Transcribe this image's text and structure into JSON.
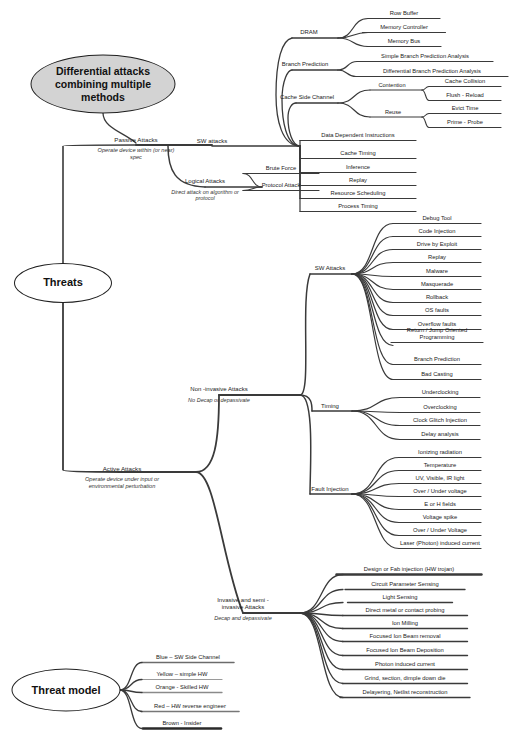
{
  "diagram": {
    "title_nodes": [
      {
        "id": "differential",
        "label": "Differential attacks combining multiple methods",
        "style": "filled-ellipse",
        "cx": 103,
        "cy": 84,
        "w": 143,
        "h": 57,
        "font": 10.5
      },
      {
        "id": "threats",
        "label": "Threats",
        "style": "plain-ellipse",
        "cx": 63,
        "cy": 283,
        "w": 96,
        "h": 38,
        "font": 11
      },
      {
        "id": "threat_model",
        "label": "Threat model",
        "style": "plain-ellipse",
        "cx": 66,
        "cy": 690,
        "w": 107,
        "h": 41,
        "font": 11
      }
    ],
    "branches": [
      {
        "id": "passive",
        "label": "Passive Attacks",
        "sub": "Operate device within (or near) spec",
        "x": 136,
        "y": 143,
        "font": 6.2,
        "sub_font": 5.6,
        "weight": 2.0
      },
      {
        "id": "active",
        "label": "Active Attacks",
        "sub": "Operate device under input or environmental perturbation",
        "x": 122,
        "y": 472,
        "font": 6.2,
        "sub_font": 5.6,
        "weight": 2.0
      },
      {
        "id": "sw_attacks_passive",
        "label": "SW attacks",
        "x": 212,
        "y": 145,
        "font": 6.0,
        "weight": 1.6
      },
      {
        "id": "logical",
        "label": "Logical Attacks",
        "sub": "Direct attack on algorithm or protocol",
        "x": 205,
        "y": 185,
        "font": 6.0,
        "sub_font": 5.4,
        "weight": 1.4
      },
      {
        "id": "dram",
        "label": "DRAM",
        "x": 309,
        "y": 36,
        "font": 5.9,
        "weight": 1.3
      },
      {
        "id": "branch_prediction",
        "label": "Branch Prediction",
        "x": 305,
        "y": 68,
        "font": 5.9,
        "weight": 1.3
      },
      {
        "id": "cache_side_channel",
        "label": "Cache Side Channel",
        "x": 307,
        "y": 101,
        "font": 5.9,
        "weight": 1.3
      },
      {
        "id": "contention",
        "label": "Contention",
        "x": 392,
        "y": 89,
        "font": 5.6,
        "weight": 1.1
      },
      {
        "id": "reuse",
        "label": "Reuse",
        "x": 393,
        "y": 116,
        "font": 5.6,
        "weight": 1.1
      },
      {
        "id": "non_invasive",
        "label": "Non -invasive Attacks",
        "sub": "No Decap or depassivate",
        "x": 219,
        "y": 393,
        "font": 6.0,
        "sub_font": 5.5,
        "weight": 1.8
      },
      {
        "id": "invasive",
        "label": "Invasive and semi - invasive Attacks",
        "sub": "Decap and depassivate",
        "x": 243,
        "y": 611,
        "font": 6.0,
        "sub_font": 5.5,
        "weight": 1.8,
        "two_line": true
      },
      {
        "id": "sw_attacks_active",
        "label": "SW Attacks",
        "x": 330,
        "y": 272,
        "font": 6.0,
        "weight": 1.5
      },
      {
        "id": "timing",
        "label": "Timing",
        "x": 330,
        "y": 410,
        "font": 6.0,
        "weight": 1.5
      },
      {
        "id": "fault_injection",
        "label": "Fault Injection",
        "x": 330,
        "y": 493,
        "font": 6.0,
        "weight": 1.5
      }
    ],
    "leaves": [
      {
        "id": "row_buffer",
        "label": "Row Buffer",
        "x": 404,
        "y": 17,
        "w": 72,
        "weight": 1.2
      },
      {
        "id": "memory_controller",
        "label": "Memory Controller",
        "x": 404,
        "y": 31,
        "w": 83,
        "weight": 1.2
      },
      {
        "id": "memory_bus",
        "label": "Memory Bus",
        "x": 404,
        "y": 45,
        "w": 74,
        "weight": 1.2
      },
      {
        "id": "simple_bpa",
        "label": "Simple Branch Prediction Analysis",
        "x": 425,
        "y": 60,
        "w": 136,
        "weight": 1.2
      },
      {
        "id": "diff_bpa",
        "label": "Differential Branch Prediction Analysis",
        "x": 432,
        "y": 75,
        "w": 152,
        "weight": 1.2
      },
      {
        "id": "cache_collision",
        "label": "Cache Collision",
        "x": 465,
        "y": 85,
        "w": 72,
        "weight": 1.1
      },
      {
        "id": "flush_reload",
        "label": "Flush - Reload",
        "x": 465,
        "y": 99,
        "w": 72,
        "weight": 1.1
      },
      {
        "id": "evict_time",
        "label": "Evict Time",
        "x": 465,
        "y": 112,
        "w": 72,
        "weight": 1.1
      },
      {
        "id": "prime_probe",
        "label": "Prime - Probe",
        "x": 465,
        "y": 126,
        "w": 72,
        "weight": 1.1
      },
      {
        "id": "data_dep_instr",
        "label": "Data Dependent Instructions",
        "x": 358,
        "y": 139,
        "w": 116,
        "weight": 1.2
      },
      {
        "id": "cache_timing",
        "label": "Cache Timing",
        "x": 358,
        "y": 157,
        "w": 116,
        "weight": 1.2
      },
      {
        "id": "inference",
        "label": "Inference",
        "x": 358,
        "y": 171,
        "w": 116,
        "weight": 1.2
      },
      {
        "id": "replay_passive",
        "label": "Replay",
        "x": 358,
        "y": 184,
        "w": 116,
        "weight": 1.2
      },
      {
        "id": "resource_scheduling",
        "label": "Resource Scheduling",
        "x": 358,
        "y": 197,
        "w": 116,
        "weight": 1.2
      },
      {
        "id": "process_timing",
        "label": "Process Timing",
        "x": 358,
        "y": 210,
        "w": 116,
        "weight": 1.2
      },
      {
        "id": "brute_force",
        "label": "Brute Force",
        "x": 281,
        "y": 172,
        "w": 76,
        "weight": 1.1
      },
      {
        "id": "protocol_attack",
        "label": "Protocol Attack",
        "x": 281,
        "y": 189,
        "w": 76,
        "weight": 1.1
      },
      {
        "id": "debug_tool",
        "label": "Debug Tool",
        "x": 437,
        "y": 222,
        "w": 88,
        "weight": 1.2
      },
      {
        "id": "code_injection",
        "label": "Code Injection",
        "x": 437,
        "y": 235,
        "w": 88,
        "weight": 1.2
      },
      {
        "id": "drive_by_exploit",
        "label": "Drive by Exploit",
        "x": 437,
        "y": 248,
        "w": 88,
        "weight": 1.2
      },
      {
        "id": "replay_sw",
        "label": "Replay",
        "x": 437,
        "y": 261,
        "w": 88,
        "weight": 1.2
      },
      {
        "id": "malware",
        "label": "Malware",
        "x": 437,
        "y": 275,
        "w": 88,
        "weight": 1.2
      },
      {
        "id": "masquerade",
        "label": "Masquerade",
        "x": 437,
        "y": 288,
        "w": 88,
        "weight": 1.2
      },
      {
        "id": "rollback",
        "label": "Rollback",
        "x": 437,
        "y": 301,
        "w": 88,
        "weight": 1.2
      },
      {
        "id": "os_faults",
        "label": "OS faults",
        "x": 437,
        "y": 314,
        "w": 88,
        "weight": 1.2
      },
      {
        "id": "overflow_faults",
        "label": "Overflow faults",
        "x": 437,
        "y": 328,
        "w": 88,
        "weight": 1.2
      },
      {
        "id": "rop_jop",
        "label": "Return / Jump Oriented Programming",
        "x": 437,
        "y": 341,
        "w": 92,
        "weight": 1.2,
        "two_line": true
      },
      {
        "id": "branch_prediction_sw",
        "label": "Branch Prediction",
        "x": 437,
        "y": 363,
        "w": 88,
        "weight": 1.2
      },
      {
        "id": "bad_casting",
        "label": "Bad Casting",
        "x": 437,
        "y": 378,
        "w": 88,
        "weight": 1.2
      },
      {
        "id": "underclocking",
        "label": "Underclocking",
        "x": 440,
        "y": 396,
        "w": 80,
        "weight": 1.2
      },
      {
        "id": "overclocking",
        "label": "Overclocking",
        "x": 440,
        "y": 411,
        "w": 80,
        "weight": 1.2
      },
      {
        "id": "clock_glitch",
        "label": "Clock Glitch Injection",
        "x": 440,
        "y": 424,
        "w": 80,
        "weight": 1.2
      },
      {
        "id": "delay_analysis",
        "label": "Delay analysis",
        "x": 440,
        "y": 438,
        "w": 80,
        "weight": 1.2
      },
      {
        "id": "ionizing_radiation",
        "label": "Ionizing radiation",
        "x": 440,
        "y": 456,
        "w": 82,
        "weight": 1.2
      },
      {
        "id": "temperature",
        "label": "Temperature",
        "x": 440,
        "y": 469,
        "w": 82,
        "weight": 1.2
      },
      {
        "id": "uv_vis_ir",
        "label": "UV, Visible, IR light",
        "x": 440,
        "y": 482,
        "w": 82,
        "weight": 1.2
      },
      {
        "id": "over_under_voltage_1",
        "label": "Over / Under voltage",
        "x": 440,
        "y": 495,
        "w": 82,
        "weight": 1.2
      },
      {
        "id": "e_or_h_fields",
        "label": "E or H fields",
        "x": 440,
        "y": 508,
        "w": 82,
        "weight": 1.2
      },
      {
        "id": "voltage_spike",
        "label": "Voltage spike",
        "x": 440,
        "y": 521,
        "w": 82,
        "weight": 1.2
      },
      {
        "id": "over_under_voltage_2",
        "label": "Over / Under Voltage",
        "x": 440,
        "y": 534,
        "w": 82,
        "weight": 1.2
      },
      {
        "id": "laser_photon",
        "label": "Laser (Photon) induced current",
        "x": 440,
        "y": 547,
        "w": 82,
        "weight": 1.2
      },
      {
        "id": "design_fab_injection",
        "label": "Design or Fab injection (HW trojan)",
        "x": 409,
        "y": 573,
        "w": 145,
        "weight": 2.4
      },
      {
        "id": "circuit_param_sensing",
        "label": "Circuit Parameter Sensing",
        "x": 405,
        "y": 588,
        "w": 120,
        "weight": 1.4
      },
      {
        "id": "light_sensing",
        "label": "Light Sensing",
        "x": 400,
        "y": 601,
        "w": 105,
        "weight": 1.4
      },
      {
        "id": "direct_probing",
        "label": "Direct metal or contact probing",
        "x": 405,
        "y": 614,
        "w": 125,
        "weight": 1.4
      },
      {
        "id": "ion_milling",
        "label": "Ion Milling",
        "x": 405,
        "y": 627,
        "w": 125,
        "weight": 1.4
      },
      {
        "id": "fib_removal",
        "label": "Focused Ion Beam removal",
        "x": 405,
        "y": 640,
        "w": 125,
        "weight": 1.4
      },
      {
        "id": "fib_deposition",
        "label": "Focused Ion Beam Deposition",
        "x": 405,
        "y": 654,
        "w": 125,
        "weight": 1.4
      },
      {
        "id": "photon_induced_current",
        "label": "Photon induced current",
        "x": 405,
        "y": 668,
        "w": 125,
        "weight": 1.4
      },
      {
        "id": "grind_section",
        "label": "Grind, section, dimple down die",
        "x": 405,
        "y": 682,
        "w": 125,
        "weight": 1.4
      },
      {
        "id": "delayering",
        "label": "Delayering, Netlist reconstruction",
        "x": 405,
        "y": 696,
        "w": 130,
        "weight": 1.4
      }
    ],
    "legend": {
      "items": [
        {
          "id": "legend_blue",
          "label": "Blue – SW Side Channel",
          "x": 188,
          "y": 661,
          "w": 92,
          "weight": 1.5,
          "color": "#6b6b6b"
        },
        {
          "id": "legend_yellow",
          "label": "Yellow – simple HW",
          "x": 182,
          "y": 678,
          "w": 80,
          "weight": 1.2,
          "color": "#9a9a9a"
        },
        {
          "id": "legend_orange",
          "label": "Orange - Skilled HW",
          "x": 182,
          "y": 691,
          "w": 80,
          "weight": 1.3,
          "color": "#8a8a8a"
        },
        {
          "id": "legend_red",
          "label": "Red – HW reverse engineer",
          "x": 190,
          "y": 710,
          "w": 98,
          "weight": 1.6,
          "color": "#777777"
        },
        {
          "id": "legend_brown",
          "label": "Brown  -  Insider",
          "x": 182,
          "y": 727,
          "w": 78,
          "weight": 2.6,
          "color": "#2a2a2a"
        }
      ]
    },
    "colors": {
      "line": "#3a3a3a",
      "line_dark": "#1f1f1f",
      "fill_accent": "#d3d3d3",
      "text": "#1a1a1a",
      "background": "#ffffff"
    }
  }
}
